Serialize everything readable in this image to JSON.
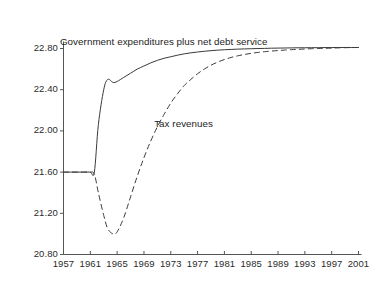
{
  "chart_data": {
    "type": "line",
    "title": "",
    "subtitle": "",
    "xlabel": "",
    "ylabel": "",
    "xlim": [
      1957,
      2001
    ],
    "ylim": [
      20.8,
      22.8
    ],
    "grid": false,
    "legend_position": "inline-annotation",
    "xticks": [
      1957,
      1961,
      1965,
      1969,
      1973,
      1977,
      1981,
      1985,
      1989,
      1993,
      1997,
      2001
    ],
    "xtick_labels": [
      "1957",
      "1961",
      "1965",
      "1969",
      "1973",
      "1977",
      "1981",
      "1985",
      "1989",
      "1993",
      "1997",
      "2001"
    ],
    "yticks": [
      20.8,
      21.2,
      21.6,
      22.0,
      22.4,
      22.8
    ],
    "ytick_labels": [
      "20.80",
      "21.20",
      "21.60",
      "22.00",
      "22.40",
      "22.80"
    ],
    "annotations": [
      {
        "text": "Government expenditures plus net debt service",
        "x": 1969,
        "y": 22.86
      },
      {
        "text": "Tax revenues",
        "x": 1975,
        "y": 22.07
      }
    ],
    "series": [
      {
        "name": "Government expenditures plus net debt service",
        "style": "solid",
        "color": "#3a3a3a",
        "x": [
          1957,
          1958,
          1959,
          1960,
          1961,
          1961.6,
          1962.2,
          1963,
          1963.6,
          1964.4,
          1965,
          1966,
          1967,
          1968,
          1969,
          1970,
          1971,
          1972,
          1973,
          1974,
          1975,
          1976,
          1977,
          1978,
          1979,
          1980,
          1981,
          1982,
          1983,
          1984,
          1985,
          1986,
          1987,
          1988,
          1989,
          1990,
          1991,
          1992,
          1993,
          1994,
          1995,
          1996,
          1997,
          1998,
          1999,
          2000,
          2001
        ],
        "values": [
          21.6,
          21.6,
          21.6,
          21.6,
          21.6,
          21.6,
          22.06,
          22.4,
          22.5,
          22.47,
          22.48,
          22.52,
          22.56,
          22.6,
          22.63,
          22.66,
          22.685,
          22.705,
          22.72,
          22.735,
          22.748,
          22.758,
          22.766,
          22.773,
          22.779,
          22.784,
          22.788,
          22.791,
          22.794,
          22.796,
          22.798,
          22.8,
          22.801,
          22.803,
          22.804,
          22.805,
          22.806,
          22.807,
          22.807,
          22.808,
          22.808,
          22.809,
          22.809,
          22.81,
          22.81,
          22.81,
          22.81
        ]
      },
      {
        "name": "Tax revenues",
        "style": "dashed",
        "color": "#3a3a3a",
        "x": [
          1957,
          1958,
          1959,
          1960,
          1961,
          1961.6,
          1962.2,
          1963,
          1963.6,
          1964.4,
          1965,
          1966,
          1967,
          1968,
          1969,
          1970,
          1971,
          1972,
          1973,
          1974,
          1975,
          1976,
          1977,
          1978,
          1979,
          1980,
          1981,
          1982,
          1983,
          1984,
          1985,
          1986,
          1987,
          1988,
          1989,
          1990,
          1991,
          1992,
          1993,
          1994,
          1995,
          1996,
          1997,
          1998,
          1999,
          2000,
          2001
        ],
        "values": [
          21.6,
          21.6,
          21.6,
          21.6,
          21.6,
          21.58,
          21.4,
          21.18,
          21.05,
          21.0,
          21.02,
          21.16,
          21.36,
          21.56,
          21.74,
          21.9,
          22.04,
          22.16,
          22.27,
          22.36,
          22.44,
          22.5,
          22.555,
          22.6,
          22.638,
          22.668,
          22.693,
          22.713,
          22.729,
          22.742,
          22.753,
          22.762,
          22.769,
          22.775,
          22.78,
          22.785,
          22.789,
          22.792,
          22.795,
          22.798,
          22.8,
          22.802,
          22.804,
          22.806,
          22.808,
          22.809,
          22.81
        ]
      }
    ]
  },
  "axes": {
    "axis_color": "#555555"
  }
}
